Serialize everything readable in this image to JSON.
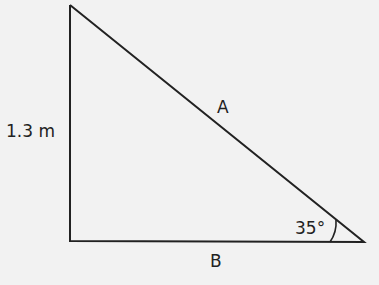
{
  "diagram": {
    "type": "right-triangle",
    "labels": {
      "vertical_side": "1.3 m",
      "hypotenuse": "A",
      "base": "B",
      "angle": "35°"
    },
    "colors": {
      "background": "#f2f2f2",
      "stroke": "#222222"
    }
  }
}
